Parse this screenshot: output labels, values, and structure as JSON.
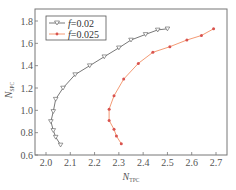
{
  "chart_data": {
    "type": "line",
    "title": "",
    "xlabel": "N_TPC",
    "xlabel_main": "N",
    "xlabel_sub": "TPC",
    "ylabel": "N_SPC",
    "ylabel_main": "N",
    "ylabel_sub": "SPC",
    "xlim": [
      1.95,
      2.75
    ],
    "ylim": [
      0.6,
      1.9
    ],
    "xticks": [
      2.0,
      2.1,
      2.2,
      2.3,
      2.4,
      2.5,
      2.6,
      2.7
    ],
    "xtick_labels": [
      "2.0",
      "2.1",
      "2.2",
      "2.3",
      "2.4",
      "2.5",
      "2.6",
      "2.7"
    ],
    "yticks": [
      0.6,
      0.8,
      1.0,
      1.2,
      1.4,
      1.6,
      1.8
    ],
    "ytick_labels": [
      "0.6",
      "0.8",
      "1.0",
      "1.2",
      "1.4",
      "1.6",
      "1.8"
    ],
    "grid": false,
    "legend_position": "upper left",
    "series": [
      {
        "name": "f=0.02",
        "legend_prefix": "f",
        "legend_value": "=0.02",
        "color": "#555555",
        "marker": "triangle-down-open",
        "x": [
          2.06,
          2.04,
          2.03,
          2.02,
          2.03,
          2.04,
          2.07,
          2.12,
          2.18,
          2.24,
          2.3,
          2.35,
          2.41,
          2.46,
          2.5
        ],
        "y": [
          0.69,
          0.76,
          0.82,
          0.9,
          0.99,
          1.1,
          1.2,
          1.32,
          1.4,
          1.48,
          1.56,
          1.63,
          1.68,
          1.72,
          1.73
        ]
      },
      {
        "name": "f=0.025",
        "legend_prefix": "f",
        "legend_value": "=0.025",
        "color": "#f08050",
        "marker_color": "#d9534f",
        "marker": "star",
        "x": [
          2.31,
          2.29,
          2.28,
          2.26,
          2.26,
          2.28,
          2.32,
          2.38,
          2.44,
          2.51,
          2.58,
          2.64,
          2.69
        ],
        "y": [
          0.7,
          0.77,
          0.83,
          0.91,
          1.01,
          1.13,
          1.28,
          1.42,
          1.52,
          1.57,
          1.63,
          1.67,
          1.73
        ]
      }
    ]
  }
}
